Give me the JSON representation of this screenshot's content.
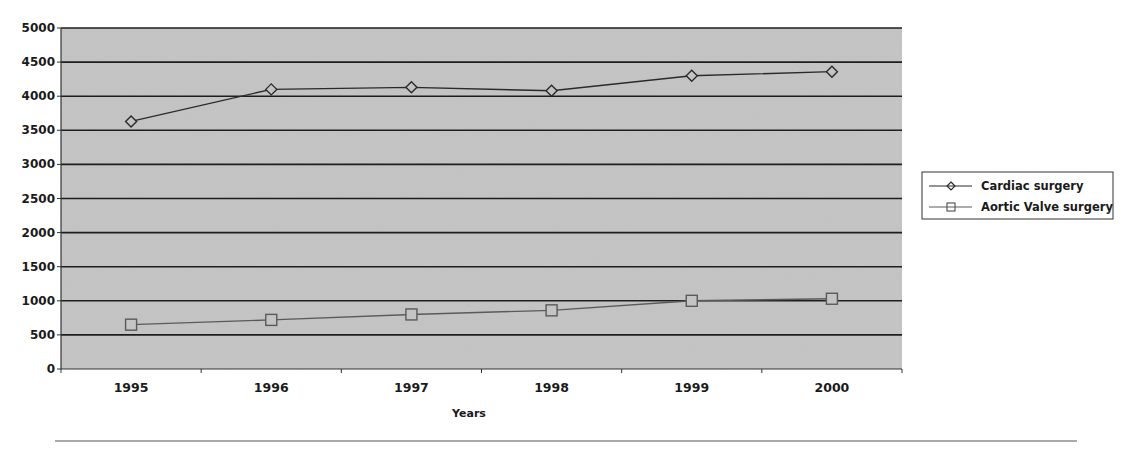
{
  "chart_data": {
    "type": "line",
    "title": "",
    "xlabel": "Years",
    "ylabel": "",
    "categories": [
      "1995",
      "1996",
      "1997",
      "1998",
      "1999",
      "2000"
    ],
    "ylim": [
      0,
      5000
    ],
    "yticks": [
      0,
      500,
      1000,
      1500,
      2000,
      2500,
      3000,
      3500,
      4000,
      4500,
      5000
    ],
    "grid": true,
    "legend_position": "right",
    "series": [
      {
        "name": "Cardiac surgery",
        "marker": "diamond",
        "color": "#2a2a2a",
        "values": [
          3630,
          4100,
          4130,
          4080,
          4300,
          4360
        ]
      },
      {
        "name": "Aortic Valve surgery",
        "marker": "square",
        "color": "#5a5a5a",
        "values": [
          650,
          720,
          800,
          860,
          1000,
          1030
        ]
      }
    ]
  },
  "colors": {
    "plot_background": "#c4c4c4",
    "gridline": "#1e1e1e",
    "axis": "#333333",
    "separator": "#aaaaaa"
  }
}
